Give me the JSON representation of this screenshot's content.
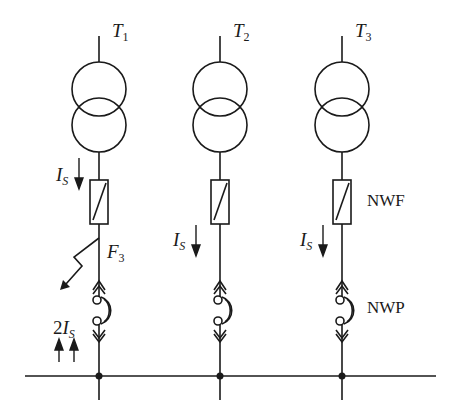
{
  "diagram": {
    "type": "electrical single-line diagram",
    "transformers": [
      {
        "id": "T1",
        "label_main": "T",
        "label_sub": "1"
      },
      {
        "id": "T2",
        "label_main": "T",
        "label_sub": "2"
      },
      {
        "id": "T3",
        "label_main": "T",
        "label_sub": "3"
      }
    ],
    "currents": [
      {
        "main": "I",
        "sub": "S"
      },
      {
        "main": "I",
        "sub": "S"
      },
      {
        "main": "I",
        "sub": "S"
      }
    ],
    "fault_current": {
      "prefix": "2",
      "main": "I",
      "sub": "S"
    },
    "fault": {
      "main": "F",
      "sub": "3"
    },
    "labels": {
      "fuse": "NWF",
      "disconnector": "NWP"
    },
    "colors": {
      "line": "#1a1a1a",
      "background": "#ffffff"
    }
  }
}
